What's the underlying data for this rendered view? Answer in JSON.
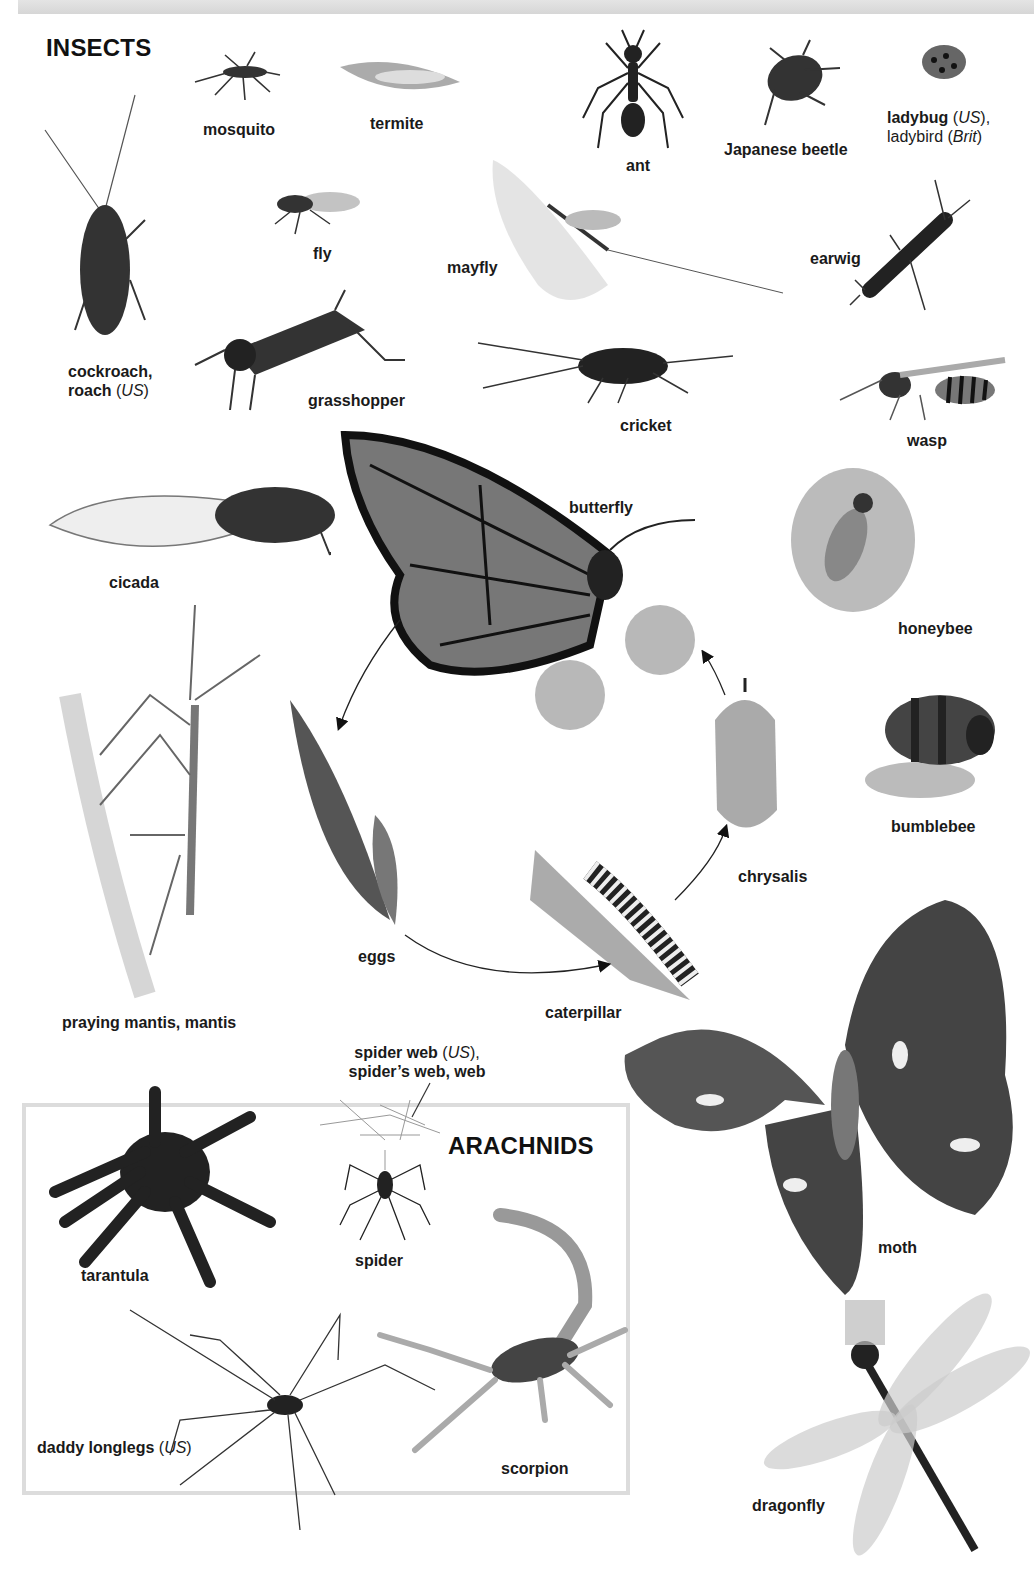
{
  "page": {
    "sections": {
      "insects_heading": "INSECTS",
      "arachnids_heading": "ARACHNIDS"
    },
    "insects": {
      "mosquito": "mosquito",
      "termite": "termite",
      "ant": "ant",
      "japanese_beetle": "Japanese beetle",
      "ladybug_main": "ladybug",
      "ladybug_us": "US",
      "ladybug_alt": "ladybird",
      "ladybug_brit": "Brit",
      "cockroach_main": "cockroach,",
      "cockroach_alt": "roach",
      "cockroach_us": "US",
      "fly": "fly",
      "mayfly": "mayfly",
      "earwig": "earwig",
      "grasshopper": "grasshopper",
      "cricket": "cricket",
      "wasp": "wasp",
      "cicada": "cicada",
      "butterfly": "butterfly",
      "honeybee": "honeybee",
      "bumblebee": "bumblebee",
      "praying_mantis": "praying mantis, mantis",
      "eggs": "eggs",
      "caterpillar": "caterpillar",
      "chrysalis": "chrysalis",
      "moth": "moth",
      "dragonfly": "dragonfly"
    },
    "arachnids": {
      "spider_web_main": "spider web",
      "spider_web_us": "US",
      "spider_web_alt": "spider’s web, web",
      "tarantula": "tarantula",
      "spider": "spider",
      "daddy_longlegs": "daddy longlegs",
      "daddy_longlegs_us": "US",
      "scorpion": "scorpion"
    },
    "colors": {
      "ink": "#111111",
      "box_border": "#dcdcdc",
      "top_strip": "#dddddd"
    }
  }
}
